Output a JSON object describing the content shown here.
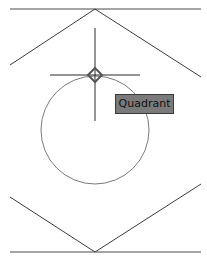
{
  "drawing": {
    "stroke_color": "#3c3c3c",
    "circle_color": "#7a7a7a",
    "background": "#ffffff"
  },
  "osnap": {
    "marker": "quadrant-diamond-marker",
    "tooltip_label": "Quadrant",
    "tooltip_bg": "#7a7a7a"
  },
  "cursor": {
    "type": "crosshair"
  }
}
